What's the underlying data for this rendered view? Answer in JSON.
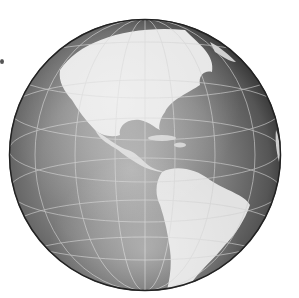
{
  "image": {
    "subject": "Grayscale globe showing the Western Hemisphere",
    "visible_regions": [
      "North America",
      "Central America",
      "Caribbean",
      "South America",
      "Greenland (partial)"
    ],
    "colors": {
      "background": "#ffffff",
      "ocean_dark": "#5a5a5a",
      "ocean_mid": "#8a8a8a",
      "land_light": "#e8e8e8",
      "graticule": "#c8c8c8"
    },
    "globe": {
      "cx": 145,
      "cy": 155,
      "r": 136
    }
  }
}
